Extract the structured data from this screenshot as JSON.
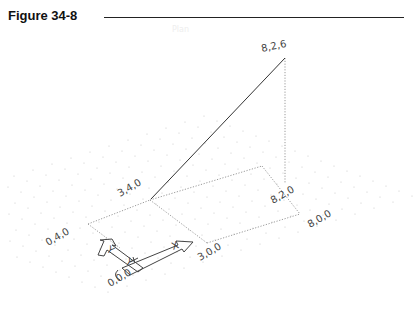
{
  "figure": {
    "title": "Figure 34-8",
    "ghost_text": "Plan"
  },
  "points": [
    {
      "id": "p826",
      "label": "8,2,6"
    },
    {
      "id": "p340",
      "label": "3,4,0"
    },
    {
      "id": "p820",
      "label": "8,2,0"
    },
    {
      "id": "p800",
      "label": "8,0,0"
    },
    {
      "id": "p300",
      "label": "3,0,0"
    },
    {
      "id": "p040",
      "label": "0,4,0"
    },
    {
      "id": "p000",
      "label": "0,0,0"
    }
  ],
  "ucs_icon": {
    "x_axis_label": "X",
    "y_axis_label": "Y"
  },
  "colors": {
    "line": "#333333",
    "dotted": "#9a9a9a",
    "grid": "#c8c8c8",
    "label": "#444444"
  }
}
